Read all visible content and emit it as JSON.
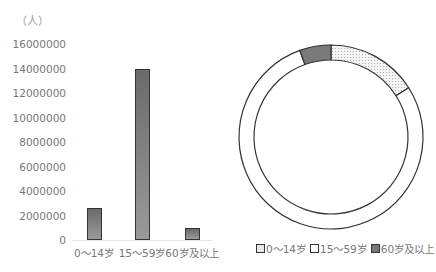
{
  "chart_data": [
    {
      "type": "bar",
      "title": "",
      "ylabel": "（人）",
      "xlabel": "",
      "categories": [
        "0～14岁",
        "15～59岁",
        "60岁及以上"
      ],
      "values": [
        2600000,
        14000000,
        1000000
      ],
      "ylim": [
        0,
        16000000
      ],
      "yticks": [
        "16000000",
        "14000000",
        "12000000",
        "10000000",
        "8000000",
        "6000000",
        "4000000",
        "2000000",
        "0"
      ],
      "grid": false,
      "legend": false
    },
    {
      "type": "pie",
      "subtype": "donut",
      "categories": [
        "0～14岁",
        "15～59岁",
        "60岁及以上"
      ],
      "values": [
        16,
        78.5,
        5.5
      ],
      "legend_position": "bottom"
    }
  ],
  "bar_chart": {
    "unit_label": "（人）",
    "yticks": [
      "16000000",
      "14000000",
      "12000000",
      "10000000",
      "8000000",
      "6000000",
      "4000000",
      "2000000",
      "0"
    ],
    "categories": [
      "0～14岁",
      "15～59岁",
      "60岁及以上"
    ]
  },
  "donut_chart": {
    "legend": [
      {
        "label": "0～14岁",
        "fill": "#e8e8e8"
      },
      {
        "label": "15～59岁",
        "fill": "#ffffff"
      },
      {
        "label": "60岁及以上",
        "fill": "#777777"
      }
    ]
  }
}
